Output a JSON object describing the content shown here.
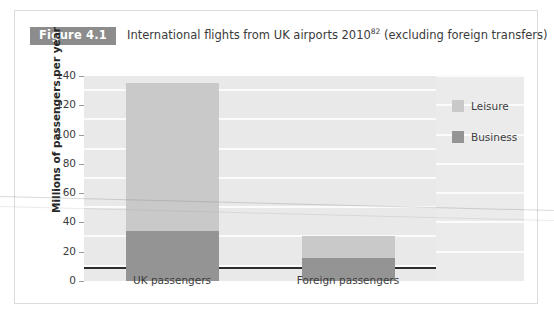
{
  "figure": {
    "badge_label": "Figure 4.1",
    "caption_main": "International flights from UK airports 2010",
    "caption_superscript": "82",
    "caption_tail": " (excluding foreign transfers)"
  },
  "colors": {
    "badge_background": "#8c8c8c",
    "badge_text": "#ffffff",
    "plot_background": "#e9e9e9",
    "gridline": "#fbfbfb",
    "axis": "#2d2d2d",
    "leisure": "#c9c9c9",
    "business": "#949494",
    "text": "#3c3c3c",
    "frame_border": "#dcdcdc"
  },
  "chart_data": {
    "type": "bar",
    "subtype": "stacked",
    "xlabel": "",
    "ylabel": "Millions of passengers per year",
    "categories": [
      "UK passengers",
      "Foreign passengers"
    ],
    "series": [
      {
        "name": "Business",
        "values": [
          34,
          16
        ],
        "color": "#949494"
      },
      {
        "name": "Leisure",
        "values": [
          101,
          15
        ],
        "color": "#c9c9c9"
      }
    ],
    "totals": [
      135,
      31
    ],
    "ylim": [
      0,
      140
    ],
    "ytick_step": 20,
    "yticks": [
      0,
      20,
      40,
      60,
      80,
      100,
      120,
      140
    ],
    "ytick_labels": [
      "0",
      "20",
      "40",
      "60",
      "80",
      "100",
      "120",
      "140"
    ],
    "grid": true,
    "grid_axis": "y",
    "legend_position": "right",
    "legend_entries": [
      "Leisure",
      "Business"
    ],
    "stack_order_bottom_to_top": [
      "Business",
      "Leisure"
    ]
  }
}
